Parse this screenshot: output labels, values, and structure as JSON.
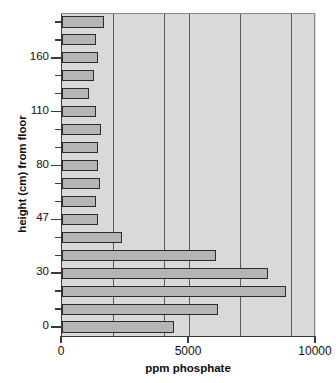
{
  "chart_data": {
    "type": "bar",
    "orientation": "horizontal",
    "title": "",
    "xlabel": "ppm phosphate",
    "ylabel": "height (cm) from floor",
    "xlim": [
      0,
      10000
    ],
    "xticks": [
      0,
      5000,
      10000
    ],
    "xticklabels": [
      "0",
      "5000",
      "10000"
    ],
    "yticklabels": [
      "160",
      "110",
      "80",
      "47",
      "30",
      "0"
    ],
    "grid": true,
    "gridlines_x": [
      2000,
      4000,
      5000,
      7000,
      9000
    ],
    "legend": "none",
    "categories": [
      "185",
      "172",
      "160",
      "148",
      "133",
      "110",
      "100",
      "90",
      "80",
      "68",
      "55",
      "47",
      "40",
      "35",
      "30",
      "22",
      "12",
      "0"
    ],
    "values": [
      1650,
      1350,
      1400,
      1250,
      1050,
      1350,
      1550,
      1400,
      1400,
      1500,
      1350,
      1400,
      2350,
      6050,
      8100,
      8800,
      6150,
      4400
    ],
    "bar_fill_color": "#b5b5b5",
    "bar_edge_color": "#2b2b2b",
    "plot_background_color": "#d9d9d9",
    "axis_color": "#3a3a3a"
  },
  "axes": {
    "y_title": "height (cm) from floor",
    "x_title": "ppm phosphate",
    "x_tick_labels": [
      "0",
      "5000",
      "10000"
    ],
    "y_tick_labels": [
      "160",
      "110",
      "80",
      "47",
      "30",
      "0"
    ]
  }
}
